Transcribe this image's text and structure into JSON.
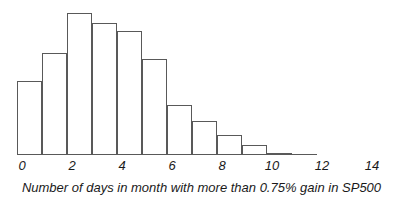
{
  "chart_data": {
    "type": "bar",
    "title": "",
    "subtitle": "",
    "xlabel": "Number of days in month with more than 0.75% gain in SP500",
    "ylabel": "",
    "grid": false,
    "legend": false,
    "axis_style": "x-axis only, italic tick labels, unfilled outlined bars",
    "bar_style": {
      "fill": "none",
      "outline_color": "#595959",
      "outline_width_px": 1
    },
    "xlim": [
      0,
      15
    ],
    "ylim": [
      0,
      75
    ],
    "xticks": [
      0,
      2,
      4,
      6,
      8,
      10,
      12,
      14
    ],
    "xtick_labels": [
      "0",
      "2",
      "4",
      "6",
      "8",
      "10",
      "12",
      "14"
    ],
    "bin_width": 1,
    "categories": [
      "0",
      "1",
      "2",
      "3",
      "4",
      "5",
      "6",
      "7",
      "8",
      "9",
      "10",
      "11"
    ],
    "bin_starts": [
      0,
      1,
      2,
      3,
      4,
      5,
      6,
      7,
      8,
      9,
      10,
      11
    ],
    "values": [
      37,
      51,
      71,
      66,
      62,
      48,
      25,
      17,
      10,
      5,
      1,
      0
    ]
  },
  "axis": {
    "xlabel": "Number of days in month with more than 0.75% gain in SP500",
    "ticks": [
      {
        "value": "0",
        "pos": 0
      },
      {
        "value": "2",
        "pos": 2
      },
      {
        "value": "4",
        "pos": 4
      },
      {
        "value": "6",
        "pos": 6
      },
      {
        "value": "8",
        "pos": 8
      },
      {
        "value": "10",
        "pos": 10
      },
      {
        "value": "12",
        "pos": 12
      },
      {
        "value": "14",
        "pos": 14
      }
    ]
  },
  "colors": {
    "outline": "#595959",
    "text": "#1a1a1a",
    "background": "#ffffff"
  }
}
